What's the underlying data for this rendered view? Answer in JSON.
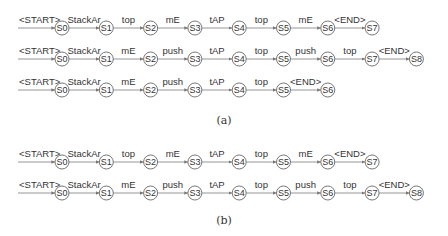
{
  "groups": [
    {
      "caption": "(a)",
      "caption_y": 124,
      "rows": [
        {
          "y": 28,
          "start_label": "<START>",
          "states": [
            "S0",
            "S1",
            "S2",
            "S3",
            "S4",
            "S5",
            "S6",
            "S7"
          ],
          "edges": [
            "StackAr",
            "top",
            "mE",
            "tAP",
            "top",
            "mE",
            "<END>"
          ]
        },
        {
          "y": 59,
          "start_label": "<START>",
          "states": [
            "S0",
            "S1",
            "S2",
            "S3",
            "S4",
            "S5",
            "S6",
            "S7",
            "S8"
          ],
          "edges": [
            "StackAr",
            "mE",
            "push",
            "tAP",
            "top",
            "push",
            "top",
            "<END>"
          ]
        },
        {
          "y": 90,
          "start_label": "<START>",
          "states": [
            "S0",
            "S1",
            "S2",
            "S3",
            "S4",
            "S5",
            "S6"
          ],
          "edges": [
            "StackAr",
            "mE",
            "push",
            "tAP",
            "top",
            "<END>"
          ]
        }
      ]
    },
    {
      "caption": "(b)",
      "caption_y": 224,
      "rows": [
        {
          "y": 162,
          "start_label": "<START>",
          "states": [
            "S0",
            "S1",
            "S2",
            "S3",
            "S4",
            "S5",
            "S6",
            "S7"
          ],
          "edges": [
            "StackAr",
            "top",
            "mE",
            "tAP",
            "top",
            "mE",
            "<END>"
          ]
        },
        {
          "y": 193,
          "start_label": "<START>",
          "states": [
            "S0",
            "S1",
            "S2",
            "S3",
            "S4",
            "S5",
            "S6",
            "S7",
            "S8"
          ],
          "edges": [
            "StackAr",
            "mE",
            "push",
            "tAP",
            "top",
            "push",
            "top",
            "<END>"
          ]
        }
      ]
    }
  ],
  "layout": {
    "start_x": 18,
    "first_node_x": 62,
    "node_spacing": 44.3,
    "node_radius": 7
  }
}
